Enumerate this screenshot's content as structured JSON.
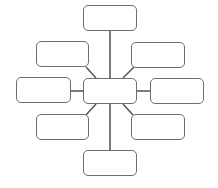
{
  "diagram": {
    "type": "spider-map",
    "line_color": "#5a5a5a",
    "border_color": "#6e6e6e",
    "center": {
      "label": "",
      "x": 83,
      "y": 78,
      "w": 54,
      "h": 26
    },
    "nodes": [
      {
        "id": "top",
        "label": "",
        "x": 83,
        "y": 5,
        "w": 54,
        "h": 26
      },
      {
        "id": "upper-left",
        "label": "",
        "x": 36,
        "y": 41,
        "w": 53,
        "h": 26
      },
      {
        "id": "upper-right",
        "label": "",
        "x": 131,
        "y": 42,
        "w": 54,
        "h": 26
      },
      {
        "id": "left",
        "label": "",
        "x": 16,
        "y": 77,
        "w": 55,
        "h": 26
      },
      {
        "id": "right",
        "label": "",
        "x": 150,
        "y": 78,
        "w": 54,
        "h": 26
      },
      {
        "id": "lower-left",
        "label": "",
        "x": 36,
        "y": 114,
        "w": 53,
        "h": 26
      },
      {
        "id": "lower-right",
        "label": "",
        "x": 131,
        "y": 114,
        "w": 54,
        "h": 26
      },
      {
        "id": "bottom",
        "label": "",
        "x": 83,
        "y": 150,
        "w": 54,
        "h": 26
      }
    ]
  }
}
